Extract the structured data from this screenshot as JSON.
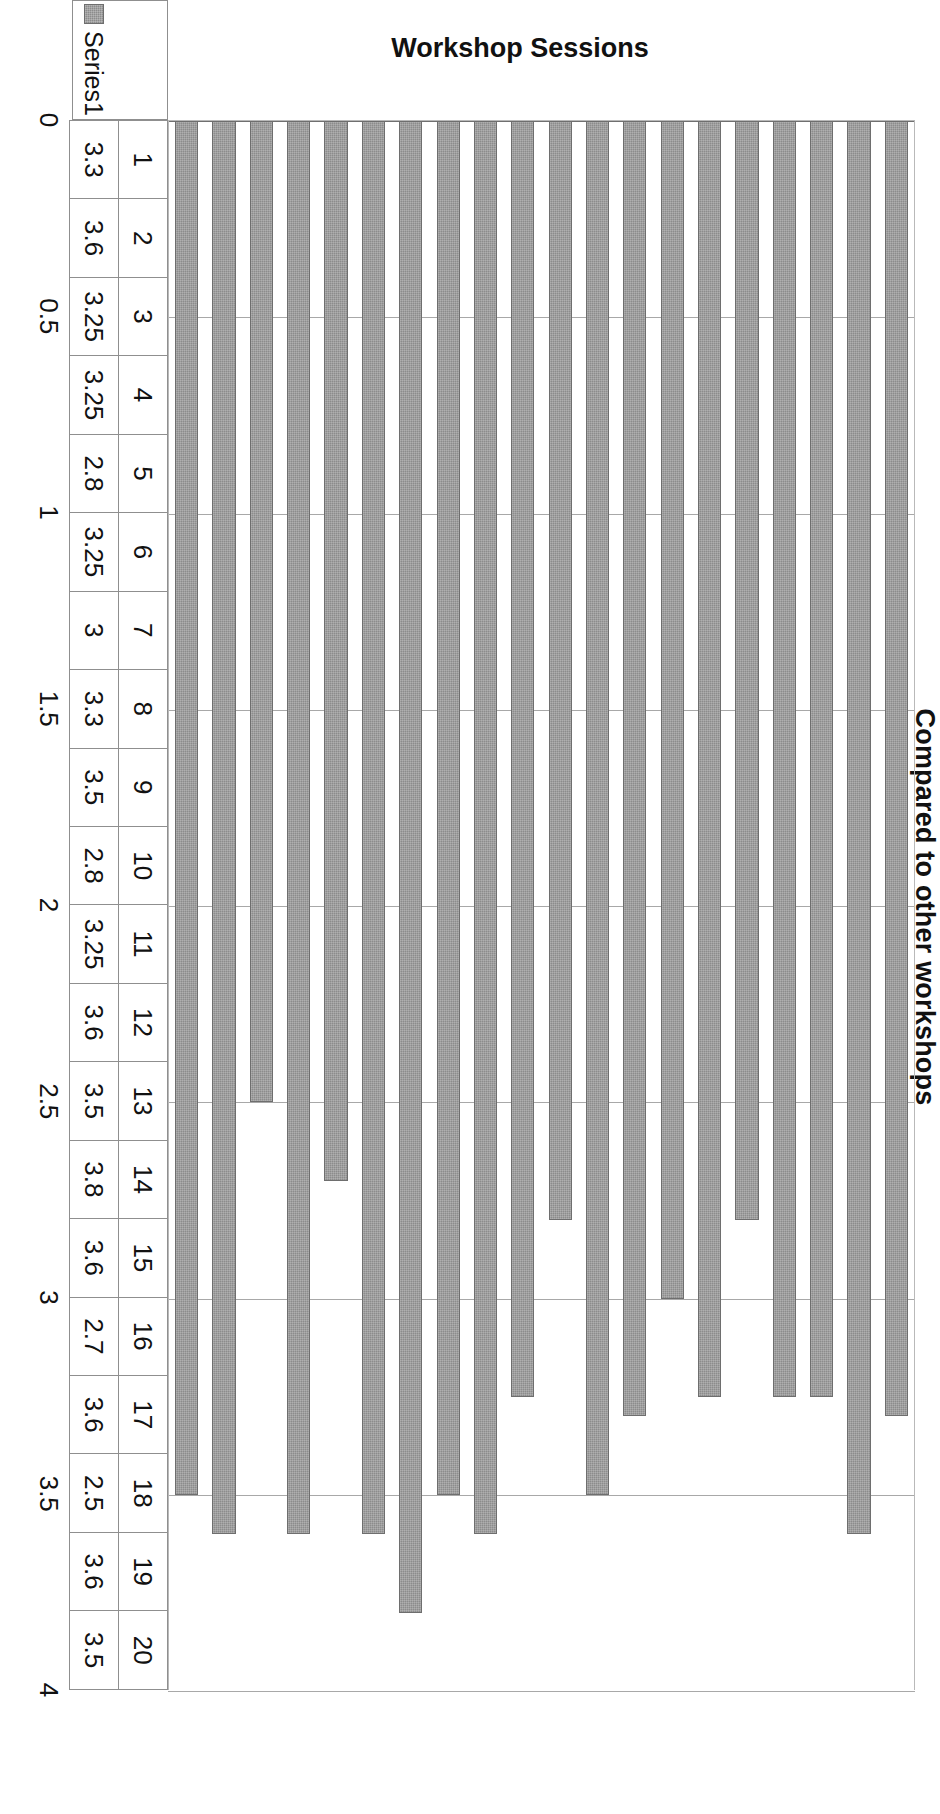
{
  "chart_data": {
    "type": "bar",
    "orientation": "horizontal-rotated",
    "title": "",
    "xlabel": "Workshop Sessions",
    "ylabel": "Compared to other workshops",
    "categories": [
      "1",
      "2",
      "3",
      "4",
      "5",
      "6",
      "7",
      "8",
      "9",
      "10",
      "11",
      "12",
      "13",
      "14",
      "15",
      "16",
      "17",
      "18",
      "19",
      "20"
    ],
    "values": [
      3.3,
      3.6,
      3.25,
      3.25,
      2.8,
      3.25,
      3,
      3.3,
      3.5,
      2.8,
      3.25,
      3.6,
      3.5,
      3.8,
      3.6,
      2.7,
      3.6,
      2.5,
      3.6,
      3.5
    ],
    "value_labels": [
      "3.3",
      "3.6",
      "3.25",
      "3.25",
      "2.8",
      "3.25",
      "3",
      "3.3",
      "3.5",
      "2.8",
      "3.25",
      "3.6",
      "3.5",
      "3.8",
      "3.6",
      "2.7",
      "3.6",
      "2.5",
      "3.6",
      "3.5"
    ],
    "ylim": [
      0,
      4
    ],
    "tick_labels": [
      "0",
      "0.5",
      "1",
      "1.5",
      "2",
      "2.5",
      "3",
      "3.5",
      "4"
    ],
    "tick_values": [
      0,
      0.5,
      1,
      1.5,
      2,
      2.5,
      3,
      3.5,
      4
    ],
    "grid": true,
    "series": [
      {
        "name": "Series1",
        "color": "#8c8c8c",
        "values": [
          3.3,
          3.6,
          3.25,
          3.25,
          2.8,
          3.25,
          3,
          3.3,
          3.5,
          2.8,
          3.25,
          3.6,
          3.5,
          3.8,
          3.6,
          2.7,
          3.6,
          2.5,
          3.6,
          3.5
        ]
      }
    ],
    "legend": {
      "position": "below-left",
      "entries": [
        "Series1"
      ]
    }
  },
  "legend": {
    "series_label": "Series1",
    "swatch_color": "#8c8c8c"
  },
  "axes": {
    "value_axis_title": "Compared to other workshops",
    "category_axis_title": "Workshop Sessions"
  },
  "colors": {
    "bar_fill": "#8c8c8c",
    "bar_border": "#6e6e6e",
    "gridline": "#a8a8a8",
    "axis": "#6f6f6f",
    "table_border": "#8f8f8f",
    "text": "#111111",
    "background": "#ffffff"
  }
}
